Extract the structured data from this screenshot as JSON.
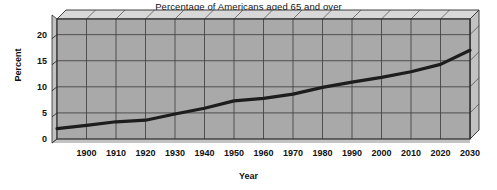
{
  "chart_data": {
    "type": "line",
    "title": "Percentage of Americans aged 65 and over",
    "xlabel": "Year",
    "ylabel": "Percent",
    "xlim": [
      1890,
      2030
    ],
    "ylim": [
      0,
      23
    ],
    "grid": true,
    "legend": null,
    "style": {
      "plot_background": "#a9a9a9",
      "gridline_color": "#454545",
      "frame_color": "#2b2b2b",
      "bevel_light": "#d8d8d8",
      "bevel_mid": "#c2c2c2",
      "line_color": "#1d1d1d",
      "page_background": "#ffffff"
    },
    "x_tick_labels": [
      "1900",
      "1910",
      "1920",
      "1930",
      "1940",
      "1950",
      "1960",
      "1970",
      "1980",
      "1990",
      "2000",
      "2010",
      "2020",
      "2030"
    ],
    "x_ticks": [
      1900,
      1910,
      1920,
      1930,
      1940,
      1950,
      1960,
      1970,
      1980,
      1990,
      2000,
      2010,
      2020,
      2030
    ],
    "y_tick_labels": [
      "0",
      "5",
      "10",
      "15",
      "20"
    ],
    "y_ticks": [
      0,
      5,
      10,
      15,
      20
    ],
    "series": [
      {
        "name": "Percentage of Americans aged 65 and over",
        "x": [
          1890,
          1900,
          1910,
          1920,
          1930,
          1940,
          1950,
          1960,
          1970,
          1980,
          1990,
          2000,
          2010,
          2020,
          2030
        ],
        "values": [
          2.0,
          2.6,
          3.3,
          3.6,
          4.8,
          5.9,
          7.3,
          7.8,
          8.6,
          9.9,
          10.9,
          11.8,
          12.9,
          14.3,
          17.0
        ]
      }
    ]
  }
}
